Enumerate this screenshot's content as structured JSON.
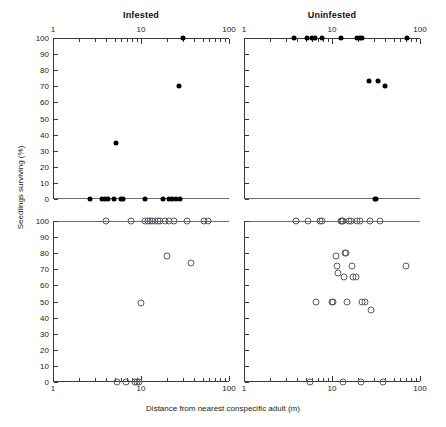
{
  "figure": {
    "xlabel": "Distance from nearest conspecific adult (m)",
    "ylabel": "Seedlings surviving (%)",
    "panel_titles": [
      "Infested",
      "Uninfested"
    ],
    "x_ticks": [
      "1",
      "10",
      "100"
    ],
    "y_ticks": [
      "0",
      "10",
      "20",
      "30",
      "40",
      "50",
      "60",
      "70",
      "80",
      "90",
      "100"
    ]
  },
  "chart_data": {
    "type": "scatter",
    "title": "",
    "xlabel": "Distance from nearest conspecific adult (m)",
    "ylabel": "Seedlings surviving (%)",
    "xscale": "log",
    "xlim": [
      1,
      100
    ],
    "ylim": [
      0,
      100
    ],
    "grid": false,
    "legend": null,
    "x_tick_labels": [
      "1",
      "10",
      "100"
    ],
    "y_tick_labels": [
      "0",
      "10",
      "20",
      "30",
      "40",
      "50",
      "60",
      "70",
      "80",
      "90",
      "100"
    ],
    "panels": [
      {
        "row": 0,
        "col": 0,
        "title": "Infested",
        "marker": "filled-circle",
        "x_axis_position": "top",
        "points": [
          {
            "x": 2.6,
            "y": 0
          },
          {
            "x": 3.6,
            "y": 0
          },
          {
            "x": 3.9,
            "y": 0
          },
          {
            "x": 4.2,
            "y": 0
          },
          {
            "x": 4.9,
            "y": 0
          },
          {
            "x": 5.2,
            "y": 35
          },
          {
            "x": 6.0,
            "y": 0
          },
          {
            "x": 6.3,
            "y": 0
          },
          {
            "x": 11.0,
            "y": 0
          },
          {
            "x": 18.0,
            "y": 0
          },
          {
            "x": 21.0,
            "y": 0
          },
          {
            "x": 22.5,
            "y": 0
          },
          {
            "x": 25.0,
            "y": 0
          },
          {
            "x": 27.0,
            "y": 70
          },
          {
            "x": 28.0,
            "y": 0
          },
          {
            "x": 30.0,
            "y": 100
          }
        ]
      },
      {
        "row": 0,
        "col": 1,
        "title": "Uninfested",
        "marker": "filled-circle",
        "x_axis_position": "top",
        "points": [
          {
            "x": 3.7,
            "y": 100
          },
          {
            "x": 5.2,
            "y": 100
          },
          {
            "x": 6.0,
            "y": 100
          },
          {
            "x": 6.4,
            "y": 100
          },
          {
            "x": 7.6,
            "y": 100
          },
          {
            "x": 12.5,
            "y": 100
          },
          {
            "x": 19.0,
            "y": 100
          },
          {
            "x": 21.0,
            "y": 100
          },
          {
            "x": 22.0,
            "y": 100
          },
          {
            "x": 26.0,
            "y": 73
          },
          {
            "x": 31.0,
            "y": 0
          },
          {
            "x": 32.0,
            "y": 0
          },
          {
            "x": 33.0,
            "y": 73
          },
          {
            "x": 40.0,
            "y": 70
          },
          {
            "x": 72.0,
            "y": 100
          }
        ]
      },
      {
        "row": 1,
        "col": 0,
        "title": "",
        "marker": "open-circle",
        "x_axis_position": "bottom",
        "points": [
          {
            "x": 4.0,
            "y": 100
          },
          {
            "x": 5.3,
            "y": 0
          },
          {
            "x": 6.8,
            "y": 0
          },
          {
            "x": 7.7,
            "y": 100
          },
          {
            "x": 8.5,
            "y": 0
          },
          {
            "x": 9.0,
            "y": 0
          },
          {
            "x": 9.6,
            "y": 0
          },
          {
            "x": 10.0,
            "y": 49
          },
          {
            "x": 11.0,
            "y": 100
          },
          {
            "x": 12.0,
            "y": 100
          },
          {
            "x": 12.8,
            "y": 100
          },
          {
            "x": 13.5,
            "y": 100
          },
          {
            "x": 14.5,
            "y": 100
          },
          {
            "x": 15.5,
            "y": 100
          },
          {
            "x": 16.5,
            "y": 100
          },
          {
            "x": 18.5,
            "y": 100
          },
          {
            "x": 20.0,
            "y": 78
          },
          {
            "x": 21.0,
            "y": 100
          },
          {
            "x": 24.0,
            "y": 100
          },
          {
            "x": 33.0,
            "y": 100
          },
          {
            "x": 37.0,
            "y": 74
          },
          {
            "x": 52.0,
            "y": 100
          },
          {
            "x": 58.0,
            "y": 100
          }
        ]
      },
      {
        "row": 1,
        "col": 1,
        "title": "",
        "marker": "open-circle",
        "x_axis_position": "bottom",
        "points": [
          {
            "x": 3.9,
            "y": 100
          },
          {
            "x": 5.3,
            "y": 100
          },
          {
            "x": 5.6,
            "y": 0
          },
          {
            "x": 6.6,
            "y": 50
          },
          {
            "x": 7.3,
            "y": 100
          },
          {
            "x": 7.7,
            "y": 100
          },
          {
            "x": 10.0,
            "y": 50
          },
          {
            "x": 10.3,
            "y": 50
          },
          {
            "x": 11.0,
            "y": 78
          },
          {
            "x": 11.5,
            "y": 72
          },
          {
            "x": 11.6,
            "y": 68
          },
          {
            "x": 12.5,
            "y": 100
          },
          {
            "x": 13.0,
            "y": 100
          },
          {
            "x": 13.3,
            "y": 100
          },
          {
            "x": 13.5,
            "y": 0
          },
          {
            "x": 13.8,
            "y": 65
          },
          {
            "x": 14.0,
            "y": 80
          },
          {
            "x": 14.6,
            "y": 80
          },
          {
            "x": 15.0,
            "y": 50
          },
          {
            "x": 15.5,
            "y": 100
          },
          {
            "x": 16.5,
            "y": 100
          },
          {
            "x": 17.0,
            "y": 72
          },
          {
            "x": 17.5,
            "y": 65
          },
          {
            "x": 18.5,
            "y": 65
          },
          {
            "x": 19.0,
            "y": 100
          },
          {
            "x": 21.0,
            "y": 100
          },
          {
            "x": 21.5,
            "y": 0
          },
          {
            "x": 22.0,
            "y": 50
          },
          {
            "x": 23.5,
            "y": 50
          },
          {
            "x": 27.0,
            "y": 100
          },
          {
            "x": 28.0,
            "y": 45
          },
          {
            "x": 35.0,
            "y": 100
          },
          {
            "x": 38.0,
            "y": 0
          },
          {
            "x": 70.0,
            "y": 72
          }
        ]
      }
    ]
  }
}
